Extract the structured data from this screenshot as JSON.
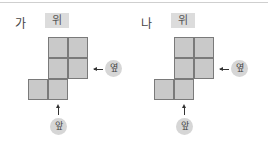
{
  "panels": [
    {
      "label": "가",
      "top_view_label": "위",
      "side_label": "옆",
      "front_label": "앞",
      "squares": [
        [
          1,
          0
        ],
        [
          2,
          0
        ],
        [
          1,
          1
        ],
        [
          2,
          1
        ],
        [
          0,
          2
        ],
        [
          1,
          2
        ]
      ]
    },
    {
      "label": "나",
      "top_view_label": "위",
      "side_label": "옆",
      "front_label": "앞",
      "squares": [
        [
          1,
          0
        ],
        [
          2,
          0
        ],
        [
          1,
          1
        ],
        [
          2,
          1
        ],
        [
          0,
          2
        ],
        [
          1,
          2
        ]
      ]
    }
  ],
  "colors": {
    "square_fill": "#c9c9c9",
    "square_border": "#7a7a7a",
    "tag_bg": "#dcdcdc"
  }
}
